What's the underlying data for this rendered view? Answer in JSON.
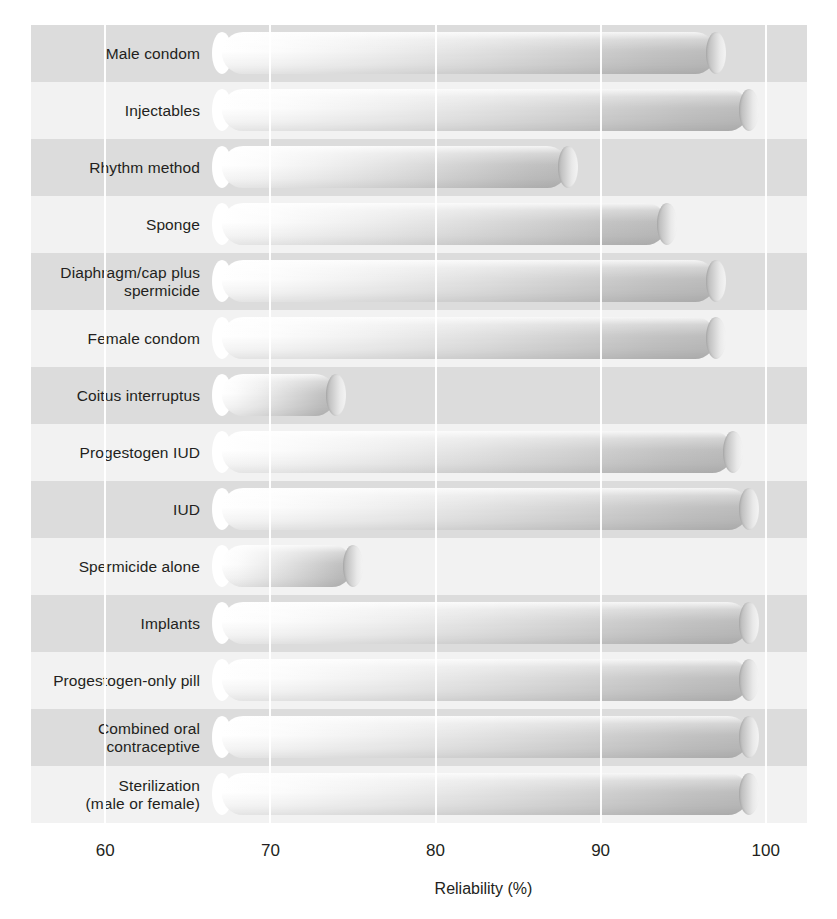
{
  "chart_data": {
    "type": "bar",
    "orientation": "horizontal",
    "title": "",
    "xlabel": "Reliability (%)",
    "ylabel": "",
    "xlim": [
      55.5,
      102.5
    ],
    "xticks": [
      60,
      70,
      80,
      90,
      100
    ],
    "xtick_labels": [
      "60",
      "70",
      "80",
      "90",
      "100"
    ],
    "grid": "vertical white gridlines at each tick",
    "legend": "none",
    "bar_style": "3D cylindrical tubes, light-to-grey horizontal gradient, rounded end caps",
    "background": "alternating horizontal grey bands per category",
    "categories": [
      "Male condom",
      "Injectables",
      "Rhythm method",
      "Sponge",
      "Diaphragm/cap plus\nspermicide",
      "Female condom",
      "Coitus interruptus",
      "Progestogen IUD",
      "IUD",
      "Spermicide alone",
      "Implants",
      "Progestogen-only pill",
      "Combined oral\ncontraceptive",
      "Sterilization\n(male or female)"
    ],
    "values": [
      97,
      99,
      88,
      94,
      97,
      97,
      74,
      98,
      99,
      75,
      99,
      99,
      99,
      99
    ],
    "colors": {
      "band_dark": "#dcdcdc",
      "band_light": "#f2f2f2",
      "gridline": "#ffffff",
      "text": "#231f20",
      "tube_light": "#ffffff",
      "tube_dark": "#bcbcbc"
    }
  },
  "axis": {
    "title": "Reliability (%)"
  }
}
